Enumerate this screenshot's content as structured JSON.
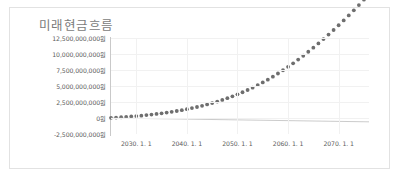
{
  "chart_data": {
    "type": "scatter",
    "title": "미래현금흐름",
    "xlabel": "",
    "ylabel": "",
    "grid": true,
    "legend": "none",
    "ylim": [
      -2500000000,
      12500000000
    ],
    "ytick_values": [
      12500000000,
      10000000000,
      7500000000,
      5000000000,
      2500000000,
      0,
      -2500000000
    ],
    "ytick_labels": [
      "12,500,000,000원",
      "10,000,000,000원",
      "7,500,000,000원",
      "5,000,000,000원",
      "2,500,000,000원",
      "0원",
      "-2,500,000,000원"
    ],
    "xlim": [
      2025,
      2076
    ],
    "xtick_labels": [
      "2030. 1. 1",
      "2040. 1. 1",
      "2050. 1. 1",
      "2060. 1. 1",
      "2070. 1. 1"
    ],
    "xtick_values": [
      2030,
      2040,
      2050,
      2060,
      2070
    ],
    "series": [
      {
        "name": "미래현금흐름",
        "type": "scatter",
        "marker": "circle",
        "color": "#6e6e6e",
        "x": [
          2025,
          2026,
          2027,
          2028,
          2029,
          2030,
          2031,
          2032,
          2033,
          2034,
          2035,
          2036,
          2037,
          2038,
          2039,
          2040,
          2041,
          2042,
          2043,
          2044,
          2045,
          2046,
          2047,
          2048,
          2049,
          2050,
          2051,
          2052,
          2053,
          2054,
          2055,
          2056,
          2057,
          2058,
          2059,
          2060,
          2061,
          2062,
          2063,
          2064,
          2065,
          2066,
          2067,
          2068,
          2069,
          2070,
          2071,
          2072,
          2073,
          2074,
          2075,
          2076
        ],
        "values": [
          30000000,
          70000000,
          120000000,
          175000000,
          235000000,
          300000000,
          370000000,
          450000000,
          535000000,
          630000000,
          730000000,
          840000000,
          960000000,
          1090000000,
          1230000000,
          1380000000,
          1545000000,
          1720000000,
          1910000000,
          2115000000,
          2335000000,
          2570000000,
          2825000000,
          3095000000,
          3385000000,
          3695000000,
          4025000000,
          4375000000,
          4745000000,
          5140000000,
          5555000000,
          5995000000,
          6460000000,
          6950000000,
          7460000000,
          7995000000,
          8550000000,
          9130000000,
          9730000000,
          10350000000,
          10990000000,
          11650000000,
          12330000000,
          13030000000,
          13750000000,
          14490000000,
          15250000000,
          16030000000,
          16830000000,
          17650000000,
          18490000000,
          19350000000
        ]
      },
      {
        "name": "baseline",
        "type": "line",
        "color": "#b5b5b5",
        "x": [
          2025,
          2076
        ],
        "values": [
          0,
          -600000000
        ]
      }
    ]
  },
  "chart": {
    "title": "미래현금흐름"
  }
}
